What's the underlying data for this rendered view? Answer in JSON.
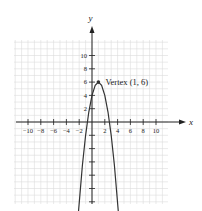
{
  "chart_data": {
    "type": "line",
    "title": "",
    "xlabel": "x",
    "ylabel": "y",
    "xlim": [
      -12,
      12
    ],
    "ylim": [
      -14,
      12
    ],
    "grid": true,
    "x_ticks": [
      -10,
      -8,
      -6,
      -4,
      -2,
      2,
      4,
      6,
      8,
      10
    ],
    "x_tick_labels": [
      "−10",
      "−8",
      "−6",
      "−4",
      "−2",
      "2",
      "4",
      "6",
      "8",
      "10"
    ],
    "y_ticks": [
      2,
      4,
      6,
      8,
      10
    ],
    "y_tick_labels": [
      "2",
      "4",
      "6",
      "8",
      "10"
    ],
    "series": [
      {
        "name": "parabola",
        "equation": "y = -2(x - 1)^2 + 6",
        "x": [
          -2.2,
          -1.5,
          -1,
          -0.5,
          0,
          0.5,
          1,
          1.5,
          2,
          2.5,
          3,
          3.5,
          4.2
        ],
        "values": [
          -14.48,
          -6.5,
          -2,
          1.5,
          4,
          5.5,
          6,
          5.5,
          4,
          1.5,
          -2,
          -6.5,
          -14.48
        ]
      }
    ],
    "annotations": [
      {
        "text": "Vertex (1, 6)",
        "x": 1,
        "y": 6
      }
    ]
  }
}
